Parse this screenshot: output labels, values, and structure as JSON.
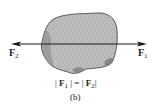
{
  "figure": {
    "subfigure_label": "(b)",
    "forces": [
      {
        "name": "F",
        "subscript": "1",
        "direction": "right"
      },
      {
        "name": "F",
        "subscript": "2",
        "direction": "left"
      }
    ],
    "equation": {
      "left_bar": "|",
      "left_symbol": "F",
      "left_sub": "1",
      "middle": "| = |",
      "right_symbol": "F",
      "right_sub": "2",
      "right_bar": "|"
    },
    "colors": {
      "body_fill": "#b8b8b8",
      "body_shade": "#8a8a8a",
      "line": "#1a1a1a"
    }
  }
}
